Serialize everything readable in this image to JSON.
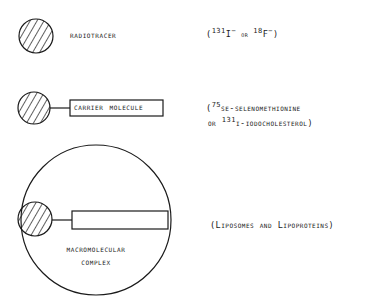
{
  "diagram": {
    "rows": [
      {
        "id": "radiotracer",
        "label": "Radiotracer",
        "note": {
          "open": "(",
          "iso1_mass": "131",
          "iso1_symbol": "I",
          "iso1_charge": "−",
          "or": " or ",
          "iso2_mass": "18",
          "iso2_symbol": "F",
          "iso2_charge": "−",
          "close": ")"
        }
      },
      {
        "id": "carrier",
        "label": "Carrier Molecule",
        "note": {
          "line1_open": "(",
          "line1_mass": "75",
          "line1_rest": "Se-selenomethionine",
          "line2_prefix": "or ",
          "line2_mass": "131",
          "line2_rest": "I-iodocholesterol)"
        }
      },
      {
        "id": "macromolecular",
        "label_line1": "Macromolecular",
        "label_line2": "Complex",
        "note": "(Liposomes and Lipoproteins)"
      }
    ],
    "colors": {
      "stroke": "#1a1a1a",
      "background": "#ffffff"
    }
  }
}
